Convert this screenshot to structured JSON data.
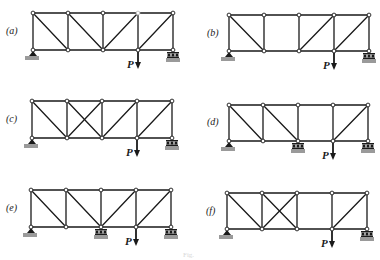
{
  "figure": {
    "caption": "Fig.",
    "panel_width_bays": 4,
    "colors": {
      "member": "#1a1a1a",
      "node_fill": "#ffffff",
      "ground": "#9a9a9a"
    }
  },
  "panels": [
    {
      "id": "a",
      "label": "(a)",
      "label_pos": [
        6,
        34
      ],
      "xs": [
        33,
        68,
        103,
        138,
        173
      ],
      "top": 13,
      "bottom": 50,
      "diagonals": [
        [
          0,
          "TL-BR"
        ],
        [
          1,
          "TL-BR"
        ],
        [
          2,
          "BL-TR"
        ],
        [
          3,
          "BL-TR"
        ]
      ],
      "cut_top_node": 3,
      "supports": [
        {
          "node": 0,
          "type": "pin"
        },
        {
          "node": 4,
          "type": "roller"
        }
      ],
      "load": {
        "node": 3,
        "label": "P"
      }
    },
    {
      "id": "b",
      "label": "(b)",
      "label_pos": [
        207,
        36
      ],
      "xs": [
        229,
        264,
        299,
        334,
        369
      ],
      "top": 15,
      "bottom": 51,
      "diagonals": [
        [
          0,
          "TL-BR"
        ],
        [
          2,
          "BL-TR"
        ],
        [
          3,
          "BL-TR"
        ]
      ],
      "supports": [
        {
          "node": 0,
          "type": "pin"
        },
        {
          "node": 4,
          "type": "roller"
        }
      ],
      "load": {
        "node": 3,
        "label": "P"
      }
    },
    {
      "id": "c",
      "label": "(c)",
      "label_pos": [
        6,
        122
      ],
      "xs": [
        32,
        67,
        102,
        137,
        172
      ],
      "top": 101,
      "bottom": 138,
      "diagonals": [
        [
          0,
          "TL-BR"
        ],
        [
          1,
          "TL-BR"
        ],
        [
          1,
          "BL-TR"
        ],
        [
          2,
          "BL-TR"
        ],
        [
          3,
          "BL-TR"
        ]
      ],
      "supports": [
        {
          "node": 0,
          "type": "pin"
        },
        {
          "node": 4,
          "type": "roller"
        }
      ],
      "load": {
        "node": 3,
        "label": "P"
      }
    },
    {
      "id": "d",
      "label": "(d)",
      "label_pos": [
        207,
        125
      ],
      "xs": [
        229,
        263,
        298,
        333,
        368
      ],
      "top": 105,
      "bottom": 141,
      "diagonals": [
        [
          0,
          "TL-BR"
        ],
        [
          1,
          "TL-BR"
        ],
        [
          3,
          "BL-TR"
        ]
      ],
      "supports": [
        {
          "node": 0,
          "type": "pin"
        },
        {
          "node": 2,
          "type": "roller"
        },
        {
          "node": 4,
          "type": "roller"
        }
      ],
      "load": {
        "node": 3,
        "label": "P"
      }
    },
    {
      "id": "e",
      "label": "(e)",
      "label_pos": [
        6,
        211
      ],
      "xs": [
        31,
        66,
        101,
        136,
        171
      ],
      "top": 190,
      "bottom": 227,
      "diagonals": [
        [
          0,
          "TL-BR"
        ],
        [
          1,
          "TL-BR"
        ],
        [
          2,
          "BL-TR"
        ],
        [
          3,
          "BL-TR"
        ]
      ],
      "supports": [
        {
          "node": 0,
          "type": "pin"
        },
        {
          "node": 2,
          "type": "roller"
        },
        {
          "node": 4,
          "type": "roller"
        }
      ],
      "load": {
        "node": 3,
        "label": "P"
      }
    },
    {
      "id": "f",
      "label": "(f)",
      "label_pos": [
        206,
        214
      ],
      "xs": [
        227,
        262,
        297,
        332,
        367
      ],
      "top": 193,
      "bottom": 229,
      "diagonals": [
        [
          0,
          "TL-BR"
        ],
        [
          1,
          "TL-BR"
        ],
        [
          1,
          "BL-TR"
        ],
        [
          3,
          "BL-TR"
        ]
      ],
      "supports": [
        {
          "node": 0,
          "type": "pin"
        },
        {
          "node": 4,
          "type": "roller"
        }
      ],
      "load": {
        "node": 3,
        "label": "P"
      }
    }
  ]
}
